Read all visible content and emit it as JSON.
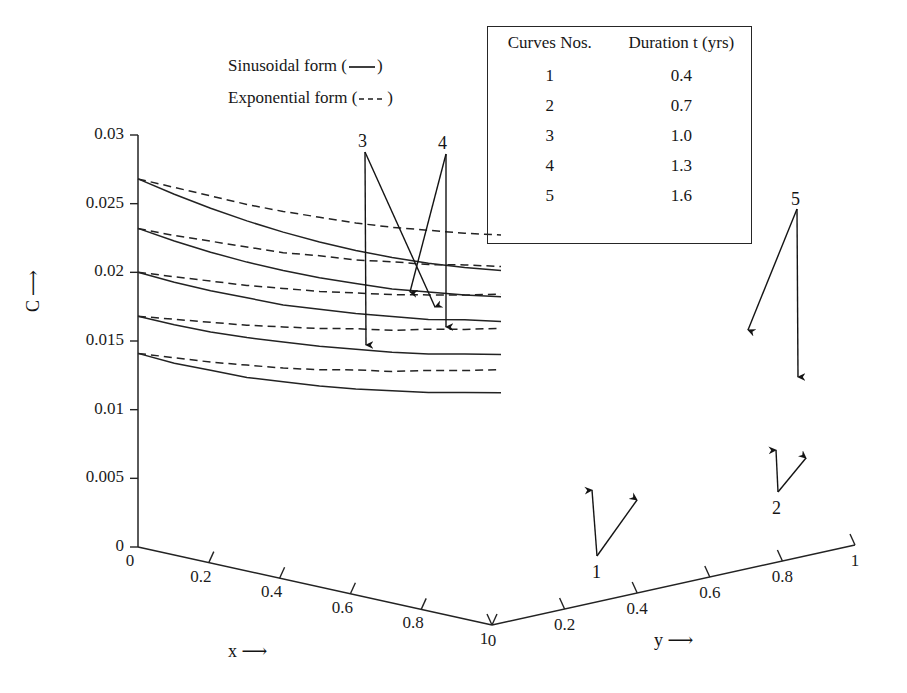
{
  "figure": {
    "title": "",
    "background": "#ffffff",
    "line_color": "#232323"
  },
  "legend": {
    "sinusoidal_label": "Sinusoidal form (",
    "sinusoidal_close": ")",
    "exponential_label": "Exponential form (",
    "exponential_close": ")",
    "solid_style": "solid",
    "dashed_style": "dashed"
  },
  "curve_table": {
    "header_curves": "Curves Nos.",
    "header_duration": "Duration t (yrs)",
    "rows": [
      {
        "curve": "1",
        "duration": "0.4"
      },
      {
        "curve": "2",
        "duration": "0.7"
      },
      {
        "curve": "3",
        "duration": "1.0"
      },
      {
        "curve": "4",
        "duration": "1.3"
      },
      {
        "curve": "5",
        "duration": "1.6"
      }
    ]
  },
  "axes": {
    "c": {
      "label": "C",
      "arrow": "⟶",
      "ticks": [
        "0",
        "0.005",
        "0.01",
        "0.015",
        "0.02",
        "0.025",
        "0.03"
      ],
      "min": 0,
      "max": 0.03,
      "step": 0.005
    },
    "x": {
      "label": "x",
      "arrow": "⟶",
      "ticks": [
        "0",
        "0.2",
        "0.4",
        "0.6",
        "0.8",
        "1"
      ],
      "min": 0,
      "max": 1
    },
    "y": {
      "label": "y",
      "arrow": "⟶",
      "ticks": [
        "0",
        "0.2",
        "0.4",
        "0.6",
        "0.8",
        "1"
      ],
      "min": 0,
      "max": 1
    }
  },
  "annotations": [
    {
      "id": "annot-1",
      "text": "1",
      "x": 592,
      "y": 562
    },
    {
      "id": "annot-2",
      "text": "2",
      "x": 772,
      "y": 498
    },
    {
      "id": "annot-3",
      "text": "3",
      "x": 358,
      "y": 131
    },
    {
      "id": "annot-4",
      "text": "4",
      "x": 438,
      "y": 133
    },
    {
      "id": "annot-5",
      "text": "5",
      "x": 791,
      "y": 189
    }
  ],
  "chart_data": {
    "type": "line",
    "title": "",
    "xlabel": "x",
    "ylabel": "C",
    "zlabel": "y",
    "projection": "3d-pseudo",
    "grid": false,
    "legend_position": "upper-left",
    "xlim": [
      0,
      1
    ],
    "ylim": [
      0,
      0.03
    ],
    "zlim": [
      0,
      1
    ],
    "x": [
      0,
      0.1,
      0.2,
      0.3,
      0.4,
      0.5,
      0.6,
      0.7,
      0.8,
      0.9,
      1.0
    ],
    "series": [
      {
        "name": "Curve 5 sinusoidal (t = 1.6 yrs)",
        "curve_no": 5,
        "duration_yrs": 1.6,
        "style": "solid",
        "values": [
          0.0268,
          0.0251,
          0.0235,
          0.022,
          0.0206,
          0.0193,
          0.0181,
          0.017,
          0.016,
          0.0151,
          0.0143
        ]
      },
      {
        "name": "Curve 5 exponential (t = 1.6 yrs)",
        "curve_no": 5,
        "duration_yrs": 1.6,
        "style": "dashed",
        "values": [
          0.0268,
          0.0256,
          0.0244,
          0.0232,
          0.0221,
          0.0211,
          0.0201,
          0.0192,
          0.0184,
          0.0176,
          0.0169
        ]
      },
      {
        "name": "Curve 4 sinusoidal (t = 1.3 yrs)",
        "curve_no": 4,
        "duration_yrs": 1.3,
        "style": "solid",
        "values": [
          0.0232,
          0.0217,
          0.0203,
          0.019,
          0.0178,
          0.0167,
          0.0157,
          0.0147,
          0.0139,
          0.0131,
          0.0124
        ]
      },
      {
        "name": "Curve 4 exponential (t = 1.3 yrs)",
        "curve_no": 4,
        "duration_yrs": 1.3,
        "style": "dashed",
        "values": [
          0.0232,
          0.0221,
          0.0211,
          0.0201,
          0.0191,
          0.0183,
          0.0174,
          0.0167,
          0.0159,
          0.0153,
          0.0146
        ]
      },
      {
        "name": "Curve 3 sinusoidal (t = 1.0 yrs)",
        "curve_no": 3,
        "duration_yrs": 1.0,
        "style": "solid",
        "values": [
          0.02,
          0.0187,
          0.0175,
          0.0164,
          0.0153,
          0.0144,
          0.0135,
          0.0127,
          0.0119,
          0.0113,
          0.0106
        ]
      },
      {
        "name": "Curve 3 exponential (t = 1.0 yrs)",
        "curve_no": 3,
        "duration_yrs": 1.0,
        "style": "dashed",
        "values": [
          0.02,
          0.0191,
          0.0182,
          0.0173,
          0.0165,
          0.0157,
          0.015,
          0.0143,
          0.0137,
          0.0131,
          0.0126
        ]
      },
      {
        "name": "Curve 2 sinusoidal (t = 0.7 yrs)",
        "curve_no": 2,
        "duration_yrs": 0.7,
        "style": "solid",
        "values": [
          0.0168,
          0.0156,
          0.0145,
          0.0135,
          0.0126,
          0.0117,
          0.0109,
          0.0101,
          0.0094,
          0.0088,
          0.0082
        ]
      },
      {
        "name": "Curve 2 exponential (t = 0.7 yrs)",
        "curve_no": 2,
        "duration_yrs": 0.7,
        "style": "dashed",
        "values": [
          0.0168,
          0.016,
          0.0152,
          0.0144,
          0.0137,
          0.013,
          0.0124,
          0.0117,
          0.0112,
          0.0106,
          0.0101
        ]
      },
      {
        "name": "Curve 1 sinusoidal (t = 0.4 yrs)",
        "curve_no": 1,
        "duration_yrs": 0.4,
        "style": "solid",
        "values": [
          0.0141,
          0.0128,
          0.0117,
          0.0106,
          0.0097,
          0.0088,
          0.008,
          0.0073,
          0.0066,
          0.006,
          0.0054
        ]
      },
      {
        "name": "Curve 1 exponential (t = 0.4 yrs)",
        "curve_no": 1,
        "duration_yrs": 0.4,
        "style": "dashed",
        "values": [
          0.0141,
          0.0132,
          0.0123,
          0.0115,
          0.0107,
          0.01,
          0.0094,
          0.0087,
          0.0082,
          0.0076,
          0.0071
        ]
      }
    ]
  }
}
